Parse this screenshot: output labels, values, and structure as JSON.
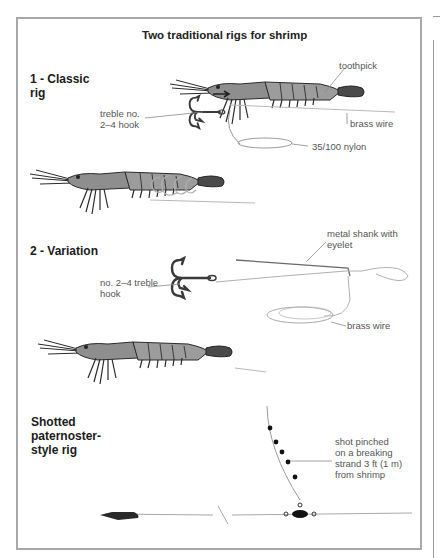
{
  "title": "Two traditional rigs for shrimp",
  "sections": [
    {
      "heading": "1 - Classic\nrig",
      "labels": {
        "toothpick": "toothpick",
        "hook": "treble no.\n2–4 hook",
        "brass_wire": "brass wire",
        "nylon": "35/100 nylon"
      }
    },
    {
      "heading": "2 - Variation",
      "labels": {
        "shank": "metal shank with\neyelet",
        "hook": "no. 2–4 treble\nhook",
        "brass_wire": "brass wire"
      }
    },
    {
      "heading": "Shotted\npaternoster-\nstyle rig",
      "labels": {
        "shot": "shot pinched\non a breaking\nstrand 3 ft (1 m)\nfrom shrimp"
      }
    }
  ],
  "colors": {
    "frame": "#a8a8a8",
    "shrimp_body": "#9a9a9a",
    "shrimp_dark": "#2a2a2a",
    "line": "#9a9a9a",
    "hook": "#3a3a3a"
  }
}
